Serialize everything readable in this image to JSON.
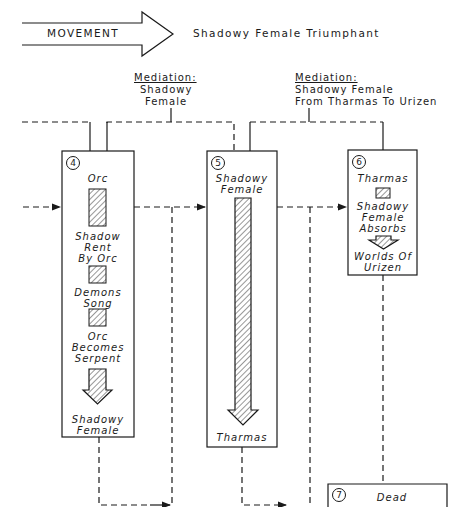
{
  "header": {
    "arrow_label": "MOVEMENT",
    "title": "Shadowy Female Triumphant"
  },
  "mediations": [
    {
      "heading": "Mediation:",
      "line1": "Shadowy",
      "line2": "Female"
    },
    {
      "heading": "Mediation:",
      "line1": "Shadowy Female",
      "line2": "From Tharmas To Urizen"
    }
  ],
  "boxes": [
    {
      "number": "4",
      "items": [
        "Orc",
        "Shadow",
        "Rent",
        "By Orc",
        "Demons",
        "Song",
        "Orc",
        "Becomes",
        "Serpent",
        "Shadowy",
        "Female"
      ]
    },
    {
      "number": "5",
      "items": [
        "Shadowy",
        "Female",
        "Tharmas"
      ]
    },
    {
      "number": "6",
      "items": [
        "Tharmas",
        "Shadowy",
        "Female",
        "Absorbs",
        "Worlds Of",
        "Urizen"
      ]
    },
    {
      "number": "7",
      "items": [
        "Dead"
      ]
    }
  ],
  "colors": {
    "ink": "#1a1a1a",
    "background": "#ffffff"
  }
}
